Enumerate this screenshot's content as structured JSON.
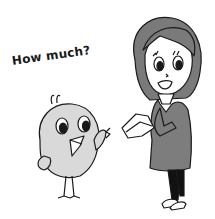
{
  "illustration": {
    "speech_text": "How much?",
    "characters": [
      "chick",
      "woman"
    ],
    "colors": {
      "background": "#ffffff",
      "outline": "#1a1a1a",
      "chick_body": "#d9d9d9",
      "hair": "#7a7a7a",
      "dress": "#7d7d7d",
      "tights": "#111111",
      "skin": "#ffffff"
    }
  }
}
